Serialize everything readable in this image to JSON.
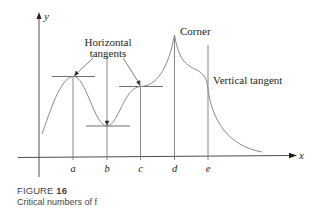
{
  "figure": {
    "caption_label": "FIGURE",
    "caption_number": "16",
    "caption_text": "Critical numbers of f"
  },
  "axes": {
    "x_label": "x",
    "y_label": "y",
    "ticks": [
      "a",
      "b",
      "c",
      "d",
      "e"
    ]
  },
  "annotations": {
    "horizontal_line1": "Horizontal",
    "horizontal_line2": "tangents",
    "corner": "Corner",
    "vertical_tangent": "Vertical tangent"
  },
  "colors": {
    "curve": "#8a8a8a",
    "axis": "#3a3a3a",
    "text": "#231f20"
  }
}
